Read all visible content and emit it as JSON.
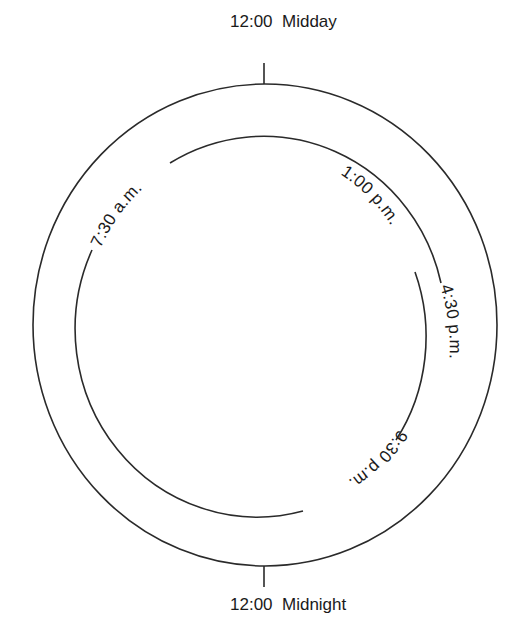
{
  "diagram": {
    "type": "clock-cycle",
    "top_label": "12:00  Midday",
    "bottom_label": "12:00  Midnight",
    "arc_labels": [
      {
        "id": "t0730",
        "text": "7:30 a.m."
      },
      {
        "id": "t1300",
        "text": "1:00 p.m."
      },
      {
        "id": "t1630",
        "text": "4:30 p.m."
      },
      {
        "id": "t2130",
        "text": "9:30 p.m."
      }
    ],
    "colors": {
      "line": "#2a2a2a",
      "text": "#1a1a1a",
      "background": "#ffffff"
    }
  }
}
